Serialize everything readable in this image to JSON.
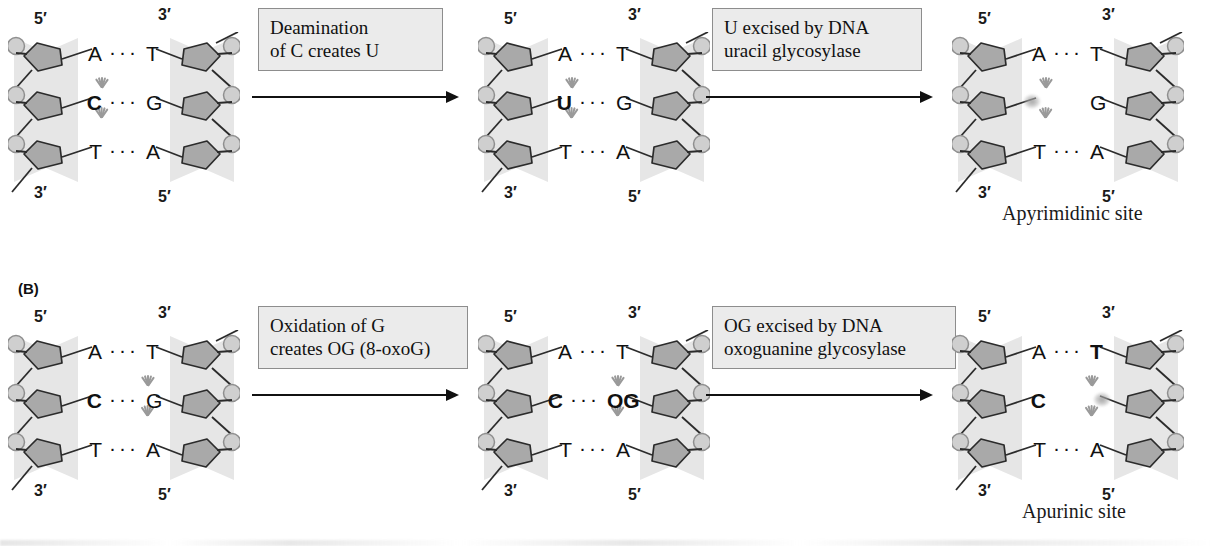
{
  "figure": {
    "panels": [
      {
        "id": "A",
        "label": "",
        "steps": [
          {
            "duplex": {
              "left_prime_top": "5′",
              "left_prime_bottom": "3′",
              "right_prime_top": "3′",
              "right_prime_bottom": "5′",
              "pairs": [
                {
                  "left": "A",
                  "bond": "···",
                  "right": "T",
                  "highlight": "none",
                  "bold_left": false,
                  "bold_right": false
                },
                {
                  "left": "C",
                  "bond": "···",
                  "right": "G",
                  "highlight": "left",
                  "bold_left": true,
                  "bold_right": false
                },
                {
                  "left": "T",
                  "bond": "···",
                  "right": "A",
                  "highlight": "none",
                  "bold_left": false,
                  "bold_right": false
                }
              ]
            },
            "arrow_label": "Deamination\nof C creates U",
            "site_caption": ""
          },
          {
            "duplex": {
              "left_prime_top": "5′",
              "left_prime_bottom": "3′",
              "right_prime_top": "3′",
              "right_prime_bottom": "5′",
              "pairs": [
                {
                  "left": "A",
                  "bond": "···",
                  "right": "T",
                  "highlight": "none",
                  "bold_left": false,
                  "bold_right": false
                },
                {
                  "left": "U",
                  "bond": "···",
                  "right": "G",
                  "highlight": "left",
                  "bold_left": true,
                  "bold_right": false
                },
                {
                  "left": "T",
                  "bond": "···",
                  "right": "A",
                  "highlight": "none",
                  "bold_left": false,
                  "bold_right": false
                }
              ]
            },
            "arrow_label": "U excised by DNA\nuracil glycosylase",
            "site_caption": ""
          },
          {
            "duplex": {
              "left_prime_top": "5′",
              "left_prime_bottom": "3′",
              "right_prime_top": "3′",
              "right_prime_bottom": "5′",
              "pairs": [
                {
                  "left": "A",
                  "bond": "···",
                  "right": "T",
                  "highlight": "none",
                  "bold_left": false,
                  "bold_right": false
                },
                {
                  "left": "",
                  "bond": "",
                  "right": "G",
                  "highlight": "left-vacant",
                  "bold_left": false,
                  "bold_right": false
                },
                {
                  "left": "T",
                  "bond": "···",
                  "right": "A",
                  "highlight": "none",
                  "bold_left": false,
                  "bold_right": false
                }
              ]
            },
            "arrow_label": "",
            "site_caption": "Apyrimidinic site"
          }
        ]
      },
      {
        "id": "B",
        "label": "(B)",
        "steps": [
          {
            "duplex": {
              "left_prime_top": "5′",
              "left_prime_bottom": "3′",
              "right_prime_top": "3′",
              "right_prime_bottom": "5′",
              "pairs": [
                {
                  "left": "A",
                  "bond": "···",
                  "right": "T",
                  "highlight": "none",
                  "bold_left": false,
                  "bold_right": false
                },
                {
                  "left": "C",
                  "bond": "···",
                  "right": "G",
                  "highlight": "right",
                  "bold_left": true,
                  "bold_right": false
                },
                {
                  "left": "T",
                  "bond": "···",
                  "right": "A",
                  "highlight": "none",
                  "bold_left": false,
                  "bold_right": false
                }
              ]
            },
            "arrow_label": "Oxidation of G\ncreates OG (8-oxoG)",
            "site_caption": ""
          },
          {
            "duplex": {
              "left_prime_top": "5′",
              "left_prime_bottom": "3′",
              "right_prime_top": "3′",
              "right_prime_bottom": "5′",
              "pairs": [
                {
                  "left": "A",
                  "bond": "···",
                  "right": "T",
                  "highlight": "none",
                  "bold_left": false,
                  "bold_right": false
                },
                {
                  "left": "C",
                  "bond": "···",
                  "right": "OG",
                  "highlight": "right",
                  "bold_left": true,
                  "bold_right": true
                },
                {
                  "left": "T",
                  "bond": "···",
                  "right": "A",
                  "highlight": "none",
                  "bold_left": false,
                  "bold_right": false
                }
              ]
            },
            "arrow_label": "OG excised by DNA\noxoguanine glycosylase",
            "site_caption": ""
          },
          {
            "duplex": {
              "left_prime_top": "5′",
              "left_prime_bottom": "3′",
              "right_prime_top": "3′",
              "right_prime_bottom": "5′",
              "pairs": [
                {
                  "left": "A",
                  "bond": "···",
                  "right": "T",
                  "highlight": "none",
                  "bold_left": false,
                  "bold_right": true
                },
                {
                  "left": "C",
                  "bond": "",
                  "right": "",
                  "highlight": "right-vacant",
                  "bold_left": true,
                  "bold_right": false
                },
                {
                  "left": "T",
                  "bond": "···",
                  "right": "A",
                  "highlight": "none",
                  "bold_left": false,
                  "bold_right": false
                }
              ]
            },
            "arrow_label": "",
            "site_caption": "Apurinic site"
          }
        ]
      }
    ],
    "colors": {
      "ribbon": "#e6e6e6",
      "sugar": "#a9a9a9",
      "sugar_stroke": "#2b2b2b",
      "phosphate": "#cfcfcf",
      "callout_bg": "#ebebeb",
      "callout_border": "#8d8d8d",
      "text": "#111111",
      "ray": "#9a9a9a"
    }
  }
}
